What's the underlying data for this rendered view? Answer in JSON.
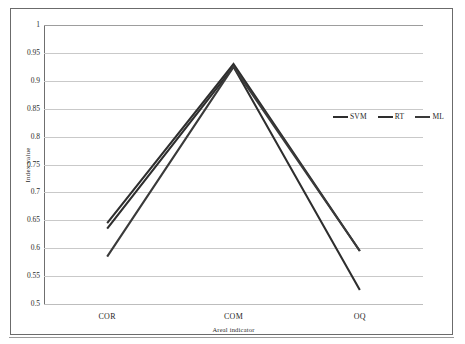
{
  "chart_data": {
    "type": "line",
    "title": "",
    "xlabel": "Areal indicator",
    "ylabel": "Index value",
    "categories": [
      "COR",
      "COM",
      "OQ"
    ],
    "ylim": [
      0.5,
      1
    ],
    "yticks": [
      1,
      0.95,
      0.9,
      0.85,
      0.8,
      0.75,
      0.7,
      0.65,
      0.6,
      0.55,
      0.5
    ],
    "ytick_labels": [
      "1",
      "0.95",
      "0.9",
      "0.85",
      "0.8",
      "0.75",
      "0.7",
      "0.65",
      "0.6",
      "0.55",
      "0.5"
    ],
    "grid": true,
    "legend_position": "center-right",
    "series": [
      {
        "name": "SVM",
        "values": [
          0.645,
          0.93,
          0.595
        ],
        "color": "#2e2e2e"
      },
      {
        "name": "RT",
        "values": [
          0.635,
          0.925,
          0.525
        ],
        "color": "#2e2e2e"
      },
      {
        "name": "ML",
        "values": [
          0.585,
          0.925,
          0.595
        ],
        "color": "#3a3a3a"
      }
    ]
  },
  "axes": {
    "y_title": "Index value",
    "x_title": "Areal indicator"
  },
  "legend": {
    "items": [
      {
        "label": "SVM"
      },
      {
        "label": "RT"
      },
      {
        "label": "ML"
      }
    ]
  },
  "colors": {
    "grid": "#c9c9c9",
    "axis": "#6f6f6f",
    "frame": "#6b6b6b",
    "series": "#2e2e2e",
    "background": "#ffffff"
  }
}
